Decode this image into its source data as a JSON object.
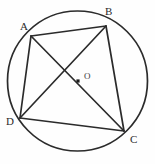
{
  "figure": {
    "background_color": "#fefefe",
    "stroke_color": "#2b2b2b",
    "circle": {
      "name": "circumscribed-circle",
      "center_x": 77.5,
      "center_y": 81,
      "radius": 70,
      "stroke_width": 1.7
    },
    "center_point": {
      "label": "O",
      "x": 78,
      "y": 81,
      "label_x": 84,
      "label_y": 79,
      "dot_size": 3.2
    },
    "vertices": [
      {
        "label": "A",
        "x": 31,
        "y": 36,
        "label_x": 20,
        "label_y": 30
      },
      {
        "label": "B",
        "x": 106,
        "y": 26,
        "label_x": 105,
        "label_y": 15
      },
      {
        "label": "C",
        "x": 124,
        "y": 131,
        "label_x": 130,
        "label_y": 143
      },
      {
        "label": "D",
        "x": 20,
        "y": 118,
        "label_x": 6,
        "label_y": 125
      }
    ],
    "segments": [
      {
        "name": "side-AB",
        "from": "A",
        "to": "B",
        "kind": "side"
      },
      {
        "name": "side-BC",
        "from": "B",
        "to": "C",
        "kind": "side"
      },
      {
        "name": "side-CD",
        "from": "C",
        "to": "D",
        "kind": "side"
      },
      {
        "name": "side-DA",
        "from": "D",
        "to": "A",
        "kind": "side"
      },
      {
        "name": "diagonal-AC",
        "from": "A",
        "to": "C",
        "kind": "diagonal"
      },
      {
        "name": "diagonal-BD",
        "from": "B",
        "to": "D",
        "kind": "diagonal"
      }
    ],
    "segment_stroke_width": 1.7
  }
}
